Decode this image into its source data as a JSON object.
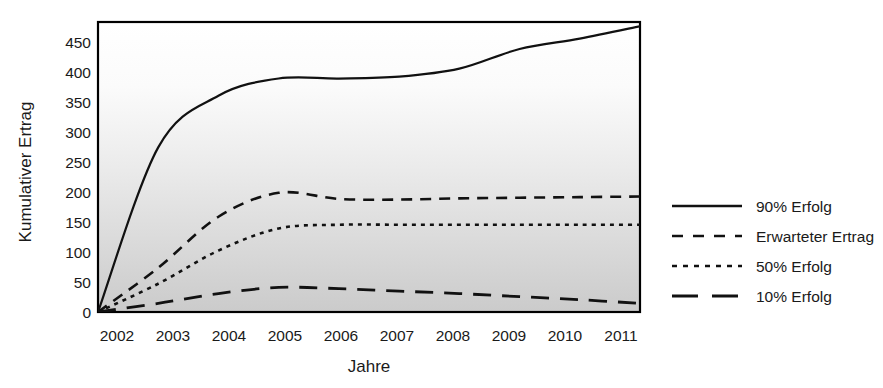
{
  "chart_data": {
    "type": "line",
    "title": "",
    "xlabel": "Jahre",
    "ylabel": "Kumulativer Ertrag",
    "x": [
      2002,
      2003,
      2004,
      2005,
      2006,
      2007,
      2008,
      2009,
      2010,
      2011
    ],
    "xtick_labels": [
      "2002",
      "2003",
      "2004",
      "2005",
      "2006",
      "2007",
      "2008",
      "2009",
      "2010",
      "2011"
    ],
    "ytick_labels": [
      "0",
      "50",
      "100",
      "150",
      "200",
      "250",
      "300",
      "350",
      "400",
      "450"
    ],
    "yticks": [
      0,
      50,
      100,
      150,
      200,
      250,
      300,
      350,
      400,
      450
    ],
    "ylim": [
      0,
      472
    ],
    "xlim": [
      2002,
      2011
    ],
    "grid": false,
    "legend_position": "right",
    "series": [
      {
        "name": "90% Erfolg",
        "style": "solid",
        "values": [
          0,
          268,
          352,
          380,
          380,
          383,
          396,
          428,
          445,
          465
        ]
      },
      {
        "name": "Erwarteter Ertrag",
        "style": "dashed",
        "values": [
          0,
          72,
          155,
          194,
          184,
          183,
          185,
          186,
          187,
          188
        ]
      },
      {
        "name": "50% Erfolg",
        "style": "dotted",
        "values": [
          0,
          46,
          100,
          136,
          142,
          142,
          142,
          142,
          142,
          142
        ]
      },
      {
        "name": "10% Erfolg",
        "style": "longdash",
        "values": [
          0,
          14,
          30,
          40,
          38,
          34,
          30,
          25,
          20,
          14
        ]
      }
    ]
  },
  "legend": {
    "items": [
      {
        "label": "90% Erfolg",
        "style": "solid"
      },
      {
        "label": "Erwarteter Ertrag",
        "style": "dashed"
      },
      {
        "label": "50% Erfolg",
        "style": "dotted"
      },
      {
        "label": "10% Erfolg",
        "style": "longdash"
      }
    ]
  },
  "colors": {
    "line": "#111111",
    "frame": "#000000",
    "plot_bg_top": "#ffffff",
    "plot_bg_bottom": "#cfcfcf",
    "text": "#1a1a1a"
  }
}
